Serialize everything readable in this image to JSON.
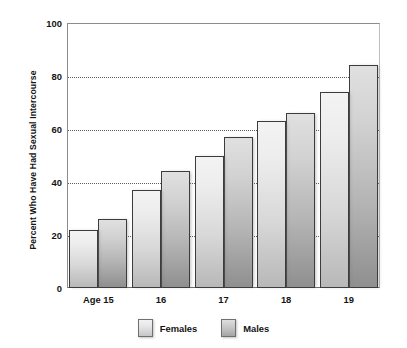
{
  "chart_data": {
    "type": "bar",
    "title": "",
    "xlabel": "",
    "ylabel": "Percent Who Have Had Sexual Intercourse",
    "categories": [
      "Age 15",
      "16",
      "17",
      "18",
      "19"
    ],
    "series": [
      {
        "name": "Females",
        "values": [
          22,
          37,
          50,
          63,
          74
        ]
      },
      {
        "name": "Males",
        "values": [
          26,
          44,
          57,
          66,
          84
        ]
      }
    ],
    "ylim": [
      0,
      100
    ],
    "yticks": [
      0,
      20,
      40,
      60,
      80,
      100
    ],
    "ytick_labels": [
      "0",
      "20",
      "40",
      "60",
      "80",
      "100"
    ],
    "grid": "horizontal-dotted",
    "legend_position": "bottom-center",
    "colors": {
      "females_top": "#f3f3f3",
      "females_bottom": "#b8b8b8",
      "males_top": "#e0e0e0",
      "males_bottom": "#8f8f8f",
      "bar_outline": "#3c3c3c",
      "gridline": "#5d5d5d",
      "axis": "#8d8d8d",
      "text": "#141414",
      "background": "#ffffff"
    }
  },
  "legend": {
    "entries": [
      {
        "label": "Females",
        "swatch": "females-swatch"
      },
      {
        "label": "Males",
        "swatch": "males-swatch"
      }
    ]
  }
}
